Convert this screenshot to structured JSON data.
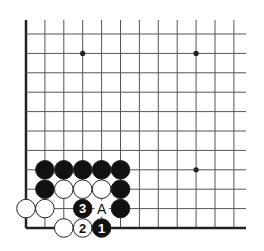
{
  "diagram": {
    "type": "go-board-corner",
    "corner": "bottom-left",
    "colors": {
      "line": "#555555",
      "edge": "#222222",
      "black_stone": "#111111",
      "white_stone": "#ffffff",
      "stone_outline": "#222222",
      "background": "#ffffff"
    },
    "grid": {
      "columns": 12,
      "rows": 11,
      "x0": 26,
      "dx": 18.9,
      "y_bottom": 228,
      "dy": 19.4,
      "top_extent": 20,
      "right_extent": 246
    },
    "star_points": [
      {
        "col": 3,
        "row": 9
      },
      {
        "col": 9,
        "row": 9
      },
      {
        "col": 9,
        "row": 3
      }
    ],
    "stones": [
      {
        "col": 1,
        "row": 3,
        "color": "black",
        "label": ""
      },
      {
        "col": 2,
        "row": 3,
        "color": "black",
        "label": ""
      },
      {
        "col": 3,
        "row": 3,
        "color": "black",
        "label": ""
      },
      {
        "col": 4,
        "row": 3,
        "color": "black",
        "label": ""
      },
      {
        "col": 5,
        "row": 3,
        "color": "black",
        "label": ""
      },
      {
        "col": 1,
        "row": 2,
        "color": "black",
        "label": ""
      },
      {
        "col": 2,
        "row": 2,
        "color": "white",
        "label": ""
      },
      {
        "col": 3,
        "row": 2,
        "color": "white",
        "label": ""
      },
      {
        "col": 4,
        "row": 2,
        "color": "white",
        "label": ""
      },
      {
        "col": 5,
        "row": 2,
        "color": "black",
        "label": ""
      },
      {
        "col": 0,
        "row": 1,
        "color": "white",
        "label": ""
      },
      {
        "col": 1,
        "row": 1,
        "color": "white",
        "label": ""
      },
      {
        "col": 3,
        "row": 1,
        "color": "black",
        "label": "3"
      },
      {
        "col": 5,
        "row": 1,
        "color": "black",
        "label": ""
      },
      {
        "col": 2,
        "row": 0,
        "color": "white",
        "label": ""
      },
      {
        "col": 3,
        "row": 0,
        "color": "white",
        "label": "2"
      },
      {
        "col": 4,
        "row": 0,
        "color": "black",
        "label": "1"
      }
    ],
    "markers": [
      {
        "col": 4,
        "row": 1,
        "text": "A"
      }
    ]
  }
}
